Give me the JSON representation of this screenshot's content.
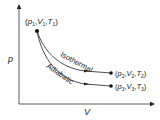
{
  "diagram": {
    "axes": {
      "y_label": "p",
      "x_label": "V"
    },
    "points": {
      "start": {
        "label": "(p1,V1,T1)",
        "p": "p",
        "p_sub": "1",
        "v": "V",
        "v_sub": "1",
        "t": "T",
        "t_sub": "1"
      },
      "isothermal_end": {
        "label": "(p2,V2,T2)",
        "p": "p",
        "p_sub": "2",
        "v": "V",
        "v_sub": "2",
        "t": "T",
        "t_sub": "2"
      },
      "adiabatic_end": {
        "label": "(p3,V3,T3)",
        "p": "p",
        "p_sub": "3",
        "v": "V",
        "v_sub": "3",
        "t": "T",
        "t_sub": "3"
      }
    },
    "curves": {
      "isothermal": "Isothermal",
      "adiabatic": "Adiabatic"
    },
    "colors": {
      "line": "#222222",
      "background": "#ffffff"
    }
  }
}
